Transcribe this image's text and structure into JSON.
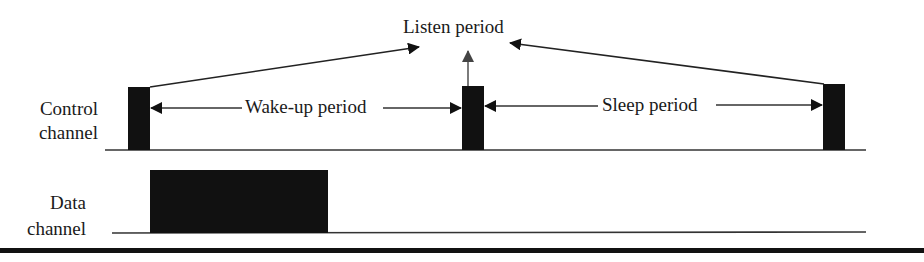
{
  "diagram": {
    "title_label": "Listen period",
    "control_channel": {
      "label_line1": "Control",
      "label_line2": "channel",
      "wakeup_label": "Wake-up period",
      "sleep_label": "Sleep period"
    },
    "data_channel": {
      "label_line1": "Data",
      "label_line2": "channel"
    },
    "colors": {
      "ink": "#111111",
      "line": "#333333",
      "background": "#ffffff"
    }
  }
}
